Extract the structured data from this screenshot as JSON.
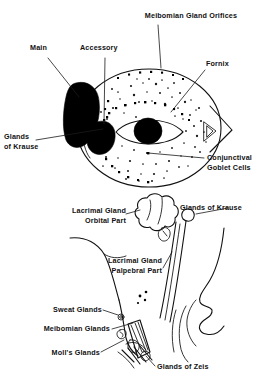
{
  "figure": {
    "panels": [
      {
        "id": "upper",
        "name": "anterior-view-panel",
        "description": "Anterior view of the eye and conjunctival sac showing lacrimal gland and glandular structures"
      },
      {
        "id": "lower",
        "name": "sagittal-section-panel",
        "description": "Sagittal section of the orbit and eyelid showing lacrimal gland parts and lid margin glands"
      }
    ]
  },
  "upper_panel": {
    "labels": {
      "meibomian_gland_orifices": "Meibomian Gland Orifices",
      "main": "Main",
      "accessory": "Accessory",
      "fornix": "Fornix",
      "glands_of_krause_line1": "Glands",
      "glands_of_krause_line2": "of Krause",
      "conjunctival_goblet_cells_line1": "Conjunctival",
      "conjunctival_goblet_cells_line2": "Goblet Cells"
    }
  },
  "lower_panel": {
    "labels": {
      "lacrimal_gland_orbital_line1": "Lacrimal Gland",
      "lacrimal_gland_orbital_line2": "Orbital Part",
      "glands_of_krause": "Glands of Krause",
      "lacrimal_gland_palpebral_line1": "Lacrimal Gland",
      "lacrimal_gland_palpebral_line2": "Palpebral Part",
      "sweat_glands": "Sweat Glands",
      "meibomian_glands": "Meibomian Glands",
      "molls_glands": "Moll's Glands",
      "glands_of_zeis": "Glands of Zeis"
    }
  },
  "colors": {
    "background": "#ffffff",
    "ink": "#111111",
    "fill_black": "#000000",
    "leader": "#1a1a1a"
  }
}
